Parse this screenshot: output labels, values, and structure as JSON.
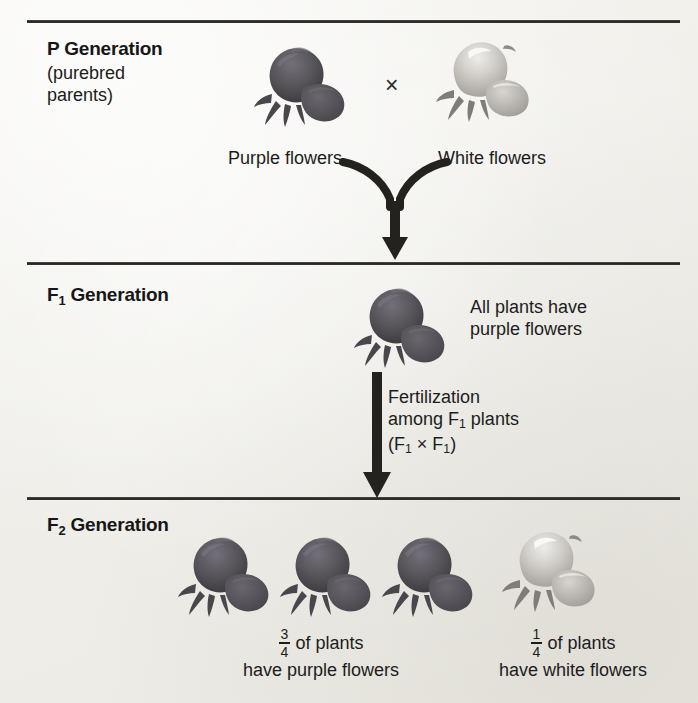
{
  "diagram": {
    "generations": [
      {
        "id": "p",
        "heading_prefix": "P",
        "heading_suffix": " Generation",
        "heading_full": "P Generation",
        "subtitle": "(purebred\nparents)",
        "parents": [
          {
            "trait": "Purple flowers",
            "color_name": "purple",
            "flower_fill": "#565358"
          },
          {
            "trait": "White flowers",
            "color_name": "white",
            "flower_fill": "#c9c6c2"
          }
        ],
        "cross_symbol": "×"
      },
      {
        "id": "f1",
        "heading_prefix": "F",
        "heading_subscript": "1",
        "heading_suffix": " Generation",
        "heading_full": "F1 Generation",
        "result_caption": "All plants have\npurple flowers",
        "offspring_color": "purple",
        "fertilization_note_line1": "Fertilization",
        "fertilization_note_line2_a": "among F",
        "fertilization_note_line2_sub": "1",
        "fertilization_note_line2_b": " plants",
        "fertilization_note_line3_a": "(F",
        "fertilization_note_line3_sub1": "1",
        "fertilization_note_line3_mid": " × F",
        "fertilization_note_line3_sub2": "1",
        "fertilization_note_line3_b": ")"
      },
      {
        "id": "f2",
        "heading_prefix": "F",
        "heading_subscript": "2",
        "heading_suffix": " Generation",
        "heading_full": "F2 Generation",
        "groups": [
          {
            "numerator": "3",
            "denominator": "4",
            "line1_suffix": "of plants",
            "line2": "have purple flowers",
            "count": 3,
            "color_name": "purple"
          },
          {
            "numerator": "1",
            "denominator": "4",
            "line1_suffix": "of plants",
            "line2": "have white flowers",
            "count": 1,
            "color_name": "white"
          }
        ]
      }
    ],
    "colors": {
      "purple_flower": "#565358",
      "white_flower": "#c9c6c2",
      "ink": "#1c1c1c",
      "rule": "#26241f",
      "paper": "#f3f2ee"
    },
    "arrows": [
      {
        "name": "p-to-f1",
        "shape": "y-merge-down"
      },
      {
        "name": "f1-to-f2",
        "shape": "straight-down"
      }
    ]
  }
}
